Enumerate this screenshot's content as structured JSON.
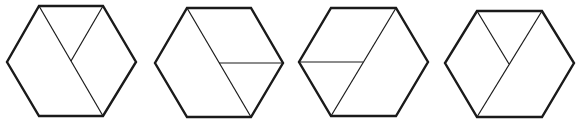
{
  "figure": {
    "stroke_color": "#1a1a1a",
    "background": "#ffffff",
    "hexagons": [
      {
        "id": "hexagon-1",
        "vertices": [
          [
            39,
            6
          ],
          [
            103,
            6
          ],
          [
            136,
            62
          ],
          [
            103,
            116
          ],
          [
            39,
            116
          ],
          [
            7,
            62
          ]
        ],
        "diagonal": [
          [
            39,
            6
          ],
          [
            103,
            116
          ]
        ],
        "spoke": [
          [
            103,
            6
          ],
          [
            71,
            61
          ]
        ]
      },
      {
        "id": "hexagon-2",
        "vertices": [
          [
            187,
            8
          ],
          [
            251,
            8
          ],
          [
            283,
            63
          ],
          [
            251,
            117
          ],
          [
            187,
            117
          ],
          [
            155,
            63
          ]
        ],
        "diagonal": [
          [
            187,
            8
          ],
          [
            251,
            117
          ]
        ],
        "spoke": [
          [
            219,
            63
          ],
          [
            283,
            63
          ]
        ]
      },
      {
        "id": "hexagon-3",
        "vertices": [
          [
            331,
            8
          ],
          [
            396,
            8
          ],
          [
            428,
            62
          ],
          [
            396,
            116
          ],
          [
            331,
            116
          ],
          [
            299,
            62
          ]
        ],
        "diagonal": [
          [
            396,
            8
          ],
          [
            331,
            116
          ]
        ],
        "spoke": [
          [
            299,
            62
          ],
          [
            363,
            62
          ]
        ]
      },
      {
        "id": "hexagon-4",
        "vertices": [
          [
            477,
            11
          ],
          [
            542,
            11
          ],
          [
            574,
            63
          ],
          [
            542,
            117
          ],
          [
            477,
            117
          ],
          [
            445,
            63
          ]
        ],
        "diagonal": [
          [
            542,
            11
          ],
          [
            477,
            117
          ]
        ],
        "spoke": [
          [
            477,
            11
          ],
          [
            509,
            64
          ]
        ]
      }
    ]
  }
}
